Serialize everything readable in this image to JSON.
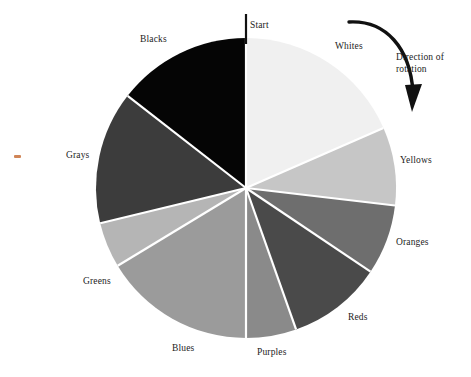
{
  "figure": {
    "start_label": "Start",
    "rotation_note_line1": "Direction of",
    "rotation_note_line2": "rotation",
    "rotation_note": "Direction of rotation"
  },
  "chart_data": {
    "type": "pie",
    "title": "",
    "subtitle": "",
    "xlabel": "",
    "ylabel": "",
    "legend_position": "outside-labels",
    "grid": false,
    "start_angle_deg": 0,
    "direction": "clockwise",
    "annotations": [
      "Start",
      "Direction of rotation"
    ],
    "categories": [
      "Whites",
      "Yellows",
      "Oranges",
      "Reds",
      "Purples",
      "Blues",
      "Greens",
      "Grays",
      "Blacks"
    ],
    "values": [
      18.4,
      8.4,
      7.6,
      10.2,
      16.2,
      16.0,
      4.9,
      14.3,
      4.0
    ],
    "angles_deg": [
      66.4,
      30.3,
      27.2,
      36.6,
      19.5,
      58.8,
      17.6,
      51.5,
      52.1
    ],
    "boundaries_deg": [
      0,
      66.4,
      96.7,
      123.9,
      160.5,
      180.0,
      238.8,
      256.4,
      307.9,
      360
    ],
    "colors": [
      "#f0f0f0",
      "#c6c6c6",
      "#6e6e6e",
      "#4a4a4a",
      "#8a8a8a",
      "#9b9b9b",
      "#b5b5b5",
      "#3c3c3c",
      "#050505"
    ],
    "slices": [
      {
        "label": "Whites",
        "color": "#f0f0f0",
        "start_deg": 0.0,
        "end_deg": 66.4,
        "percent": 18.4
      },
      {
        "label": "Yellows",
        "color": "#c6c6c6",
        "start_deg": 66.4,
        "end_deg": 96.7,
        "percent": 8.4
      },
      {
        "label": "Oranges",
        "color": "#6e6e6e",
        "start_deg": 96.7,
        "end_deg": 123.9,
        "percent": 7.6
      },
      {
        "label": "Reds",
        "color": "#4a4a4a",
        "start_deg": 123.9,
        "end_deg": 160.5,
        "percent": 10.2
      },
      {
        "label": "Purples",
        "color": "#8a8a8a",
        "start_deg": 160.5,
        "end_deg": 180.0,
        "percent": 5.4
      },
      {
        "label": "Blues",
        "color": "#9b9b9b",
        "start_deg": 180.0,
        "end_deg": 238.8,
        "percent": 16.3
      },
      {
        "label": "Greens",
        "color": "#b5b5b5",
        "start_deg": 238.8,
        "end_deg": 256.4,
        "percent": 4.9
      },
      {
        "label": "Grays",
        "color": "#3c3c3c",
        "start_deg": 256.4,
        "end_deg": 307.9,
        "percent": 14.3
      },
      {
        "label": "Blacks",
        "color": "#050505",
        "start_deg": 307.9,
        "end_deg": 360.0,
        "percent": 14.5
      }
    ]
  },
  "labels": {
    "start": "Start",
    "whites": "Whites",
    "yellows": "Yellows",
    "oranges": "Oranges",
    "reds": "Reds",
    "purples": "Purples",
    "blues": "Blues",
    "greens": "Greens",
    "grays": "Grays",
    "blacks": "Blacks",
    "direction_line1": "Direction of",
    "direction_line2": "rotation"
  },
  "geometry": {
    "center_x": 246,
    "center_y": 188,
    "radius": 150
  },
  "colors": {
    "background": "#ffffff",
    "text": "#1c1c1c",
    "separator": "#ffffff",
    "arrow": "#111111",
    "speck": "#c8703a"
  }
}
